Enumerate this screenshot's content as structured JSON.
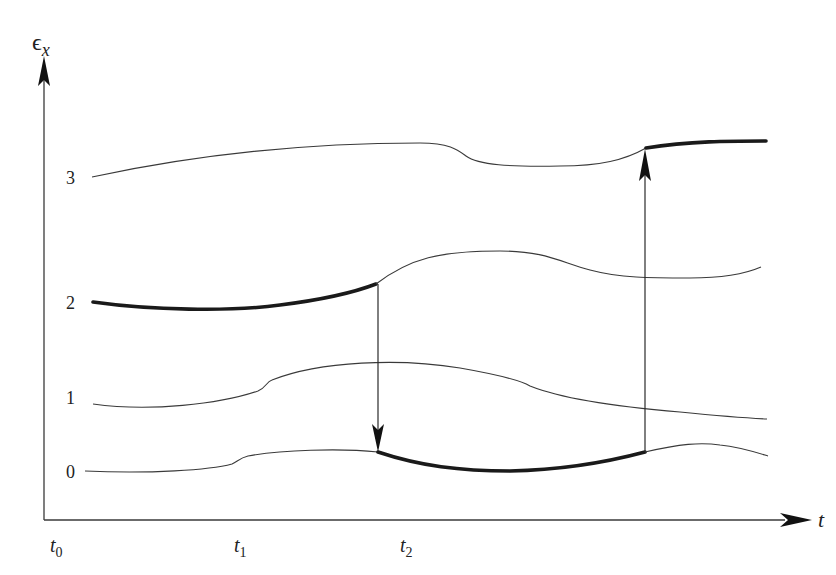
{
  "diagram": {
    "type": "energy-level-transitions",
    "y_axis_label": "ϵ",
    "y_axis_subscript": "x",
    "x_axis_label": "t",
    "levels": [
      {
        "label": "0",
        "highlighted_segment": "t1 to t2"
      },
      {
        "label": "1",
        "highlighted_segment": null
      },
      {
        "label": "2",
        "highlighted_segment": "t0 to t1"
      },
      {
        "label": "3",
        "highlighted_segment": "t2 to end"
      }
    ],
    "time_ticks": [
      {
        "label": "t",
        "subscript": "0"
      },
      {
        "label": "t",
        "subscript": "1"
      },
      {
        "label": "t",
        "subscript": "2"
      }
    ],
    "transitions": [
      {
        "at": "t1",
        "from_level": "2",
        "to_level": "0",
        "direction": "down"
      },
      {
        "at": "t2",
        "from_level": "0",
        "to_level": "3",
        "direction": "up"
      }
    ]
  }
}
